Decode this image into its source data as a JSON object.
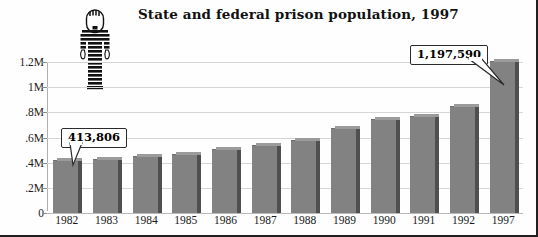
{
  "chart_data": {
    "type": "bar",
    "title": "State and federal prison population, 1997",
    "xlabel": "",
    "ylabel": "",
    "categories": [
      "1982",
      "1983",
      "1984",
      "1985",
      "1986",
      "1987",
      "1988",
      "1989",
      "1990",
      "1991",
      "1992",
      "1997"
    ],
    "values": [
      413806,
      419820,
      445000,
      462000,
      503000,
      533000,
      570000,
      670000,
      740000,
      765000,
      846000,
      1197590
    ],
    "ylim": [
      0,
      1200000
    ],
    "ytick_values": [
      0,
      200000,
      400000,
      600000,
      800000,
      1000000,
      1200000
    ],
    "ytick_labels": [
      "0",
      ".2M",
      ".4M",
      ".6M",
      ".8M",
      "1M",
      "1.2M"
    ],
    "grid": true,
    "legend": false,
    "annotations": [
      {
        "label": "413,806",
        "category": "1982"
      },
      {
        "label": "1,197,590",
        "category": "1997"
      }
    ],
    "bar_color": "#828282",
    "grid_color": "#d6d6d6"
  },
  "figure": {
    "title": "State and federal prison population, 1997",
    "icon_name": "prisoner-striped-uniform-icon"
  },
  "callouts": {
    "first": "413,806",
    "last": "1,197,590"
  }
}
